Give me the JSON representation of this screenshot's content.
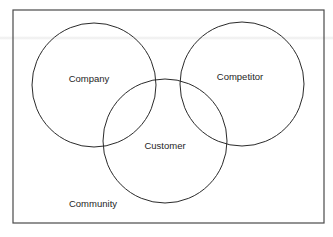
{
  "diagram": {
    "type": "venn",
    "frame": {
      "x": 13,
      "y": 10,
      "width": 311,
      "height": 213,
      "label": "Community"
    },
    "circles": [
      {
        "id": "company",
        "label": "Company",
        "cx": 94,
        "cy": 85,
        "r": 62
      },
      {
        "id": "competitor",
        "label": "Competitor",
        "cx": 242,
        "cy": 84,
        "r": 62
      },
      {
        "id": "customer",
        "label": "Customer",
        "cx": 165,
        "cy": 141,
        "r": 62
      }
    ],
    "labels": {
      "company": "Company",
      "competitor": "Competitor",
      "customer": "Customer",
      "community": "Community"
    },
    "colors": {
      "stroke": "#2a2a2a",
      "frame": "#4a4a4a",
      "text": "#1e1e1e",
      "background": "#ffffff"
    }
  }
}
